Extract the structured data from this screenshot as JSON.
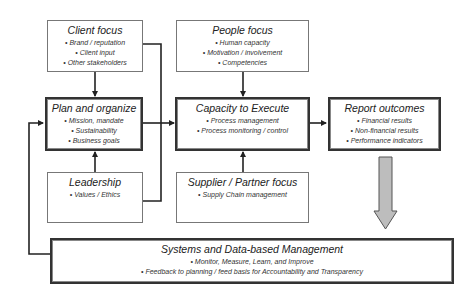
{
  "diagram": {
    "boxes": {
      "client_focus": {
        "title": "Client focus",
        "items": [
          "Brand / reputation",
          "Client input",
          "Other stakeholders"
        ]
      },
      "people_focus": {
        "title": "People focus",
        "items": [
          "Human capacity",
          "Motivation / involvement",
          "Competencies"
        ]
      },
      "plan_organize": {
        "title": "Plan and organize",
        "items": [
          "Mission, mandate",
          "Sustainability",
          "Business goals"
        ]
      },
      "capacity_execute": {
        "title": "Capacity to Execute",
        "items": [
          "Process management",
          "Process monitoring / control"
        ]
      },
      "report_outcomes": {
        "title": "Report outcomes",
        "items": [
          "Financial results",
          "Non-financial results",
          "Performance indicators"
        ]
      },
      "leadership": {
        "title": "Leadership",
        "items": [
          "Values / Ethics"
        ]
      },
      "supplier_partner": {
        "title": "Supplier / Partner focus",
        "items": [
          "Supply Chain management"
        ]
      },
      "systems_data": {
        "title": "Systems and Data-based Management",
        "items": [
          "Monitor, Measure, Learn, and Improve",
          "Feedback to planning / feed basis for Accountability and Transparency"
        ]
      }
    },
    "colors": {
      "line": "#222222",
      "thin_border": "#777777",
      "thick_border": "#333333",
      "block_arrow_fill": "#bdbdbd",
      "block_arrow_stroke": "#555555"
    }
  }
}
